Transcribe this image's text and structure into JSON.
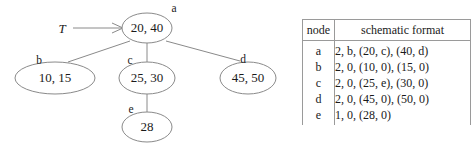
{
  "figure": {
    "kind": "b-tree-node-diagram",
    "background_color": "#ffffff",
    "line_color": "#8a8a8a",
    "text_color": "#1a1a1a"
  },
  "tree": {
    "root_pointer_label": "T",
    "nodes": [
      {
        "id": "a",
        "label": "a",
        "value": "20, 40",
        "cx": 147,
        "cy": 28,
        "rx": 25,
        "ry": 15,
        "label_x": 174,
        "label_y": 12
      },
      {
        "id": "b",
        "label": "b",
        "value": "10, 15",
        "cx": 55,
        "cy": 78,
        "rx": 40,
        "ry": 16,
        "label_x": 39,
        "label_y": 64
      },
      {
        "id": "c",
        "label": "c",
        "value": "25, 30",
        "cx": 147,
        "cy": 78,
        "rx": 28,
        "ry": 16,
        "label_x": 130,
        "label_y": 64
      },
      {
        "id": "d",
        "label": "d",
        "value": "45, 50",
        "cx": 248,
        "cy": 78,
        "rx": 28,
        "ry": 16,
        "label_x": 243,
        "label_y": 63
      },
      {
        "id": "e",
        "label": "e",
        "value": "28",
        "cx": 147,
        "cy": 127,
        "rx": 25,
        "ry": 15,
        "label_x": 131,
        "label_y": 113
      }
    ],
    "edges": [
      {
        "from": "a",
        "to": "b",
        "x1": 130,
        "y1": 41,
        "x2": 68,
        "y2": 62
      },
      {
        "from": "a",
        "to": "c",
        "x1": 147,
        "y1": 43,
        "x2": 147,
        "y2": 62
      },
      {
        "from": "a",
        "to": "d",
        "x1": 166,
        "y1": 41,
        "x2": 240,
        "y2": 61
      },
      {
        "from": "c",
        "to": "e",
        "x1": 147,
        "y1": 94,
        "x2": 147,
        "y2": 112
      }
    ],
    "root_pointer": {
      "label_x": 62,
      "label_y": 33,
      "line_x1": 73,
      "line_y1": 28,
      "line_x2": 122,
      "line_y2": 28
    }
  },
  "table": {
    "headers": [
      "node",
      "schematic format"
    ],
    "rows": [
      {
        "node": "a",
        "format": "2, b, (20, c), (40, d)"
      },
      {
        "node": "b",
        "format": "2, 0, (10, 0), (15, 0)"
      },
      {
        "node": "c",
        "format": "2, 0, (25, e), (30, 0)"
      },
      {
        "node": "d",
        "format": "2, 0, (45, 0), (50, 0)"
      },
      {
        "node": "e",
        "format": "1, 0, (28, 0)"
      }
    ]
  }
}
